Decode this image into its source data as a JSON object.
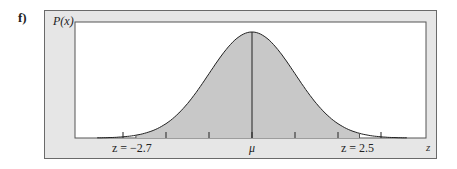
{
  "part_label": "f)",
  "chart_data": {
    "type": "area",
    "title": "",
    "ylabel": "P(x)",
    "xlabel": "z",
    "mean_label": "μ",
    "distribution": "normal",
    "x_range_sigma": [
      -3.6,
      3.6
    ],
    "tick_positions_sigma": [
      -3,
      -2,
      -1,
      0,
      1,
      2,
      3
    ],
    "shaded_interval": {
      "from": -2.7,
      "to": 2.5
    },
    "annotations": [
      {
        "label": "z = −2.7",
        "x": -2.7
      },
      {
        "label": "μ",
        "x": 0
      },
      {
        "label": "z = 2.5",
        "x": 2.5
      }
    ],
    "grid": false,
    "legend": "none",
    "colors": {
      "shade": "#c8c8c8",
      "frame_bg": "#e6e6e6",
      "plot_bg": "#ffffff",
      "line": "#222222"
    }
  },
  "labels": {
    "left_bound": "z = −2.7",
    "mean": "μ",
    "right_bound": "z = 2.5",
    "x_axis": "z",
    "y_axis": "P(x)"
  }
}
